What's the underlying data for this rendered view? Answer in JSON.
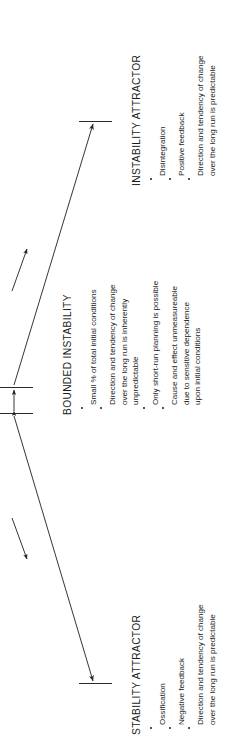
{
  "diagram": {
    "orientation": "rotated-90-ccw",
    "line_color": "#2a2a2a",
    "text_color": "#1b1b1b",
    "sections": [
      {
        "id": "instability-attractor",
        "heading": "INSTABILITY ATTRACTOR",
        "bullets": [
          [
            "Disintegration"
          ],
          [
            "Positive feedback"
          ],
          [
            "Direction and tendency of change",
            "over the long run is predictable"
          ]
        ]
      },
      {
        "id": "bounded-instability",
        "heading": "BOUNDED INSTABILITY",
        "bullets": [
          [
            "Small % of total initial conditions"
          ],
          [
            "Direction and tendency of change",
            "over the long run is inherently",
            "unpredictable"
          ],
          [
            "Only short-run planning is possible"
          ],
          [
            "Cause and effect unmeasureable",
            "due to sensitive dependence",
            "upon initial conditions"
          ]
        ]
      },
      {
        "id": "stability-attractor",
        "heading": "STABILITY ATTRACTOR",
        "bullets": [
          [
            "Ossification"
          ],
          [
            "Negative feedback"
          ],
          [
            "Direction and tendency of change",
            "over the long run is predictable"
          ]
        ]
      }
    ],
    "markers": {
      "top_boundary_tick": "instability boundary tick",
      "middle_upper_tick": "bounded instability upper boundary tick",
      "middle_lower_tick": "bounded instability lower boundary tick",
      "bottom_boundary_tick": "stability boundary tick"
    },
    "arrows": {
      "toward_instability": "long arrow pointing toward instability attractor",
      "toward_stability": "long arrow pointing toward stability attractor",
      "small_up": "short arrow indicating movement toward instability",
      "small_down": "short arrow indicating movement toward stability",
      "range_arrow": "double-headed arrow spanning the bounded instability band"
    }
  }
}
